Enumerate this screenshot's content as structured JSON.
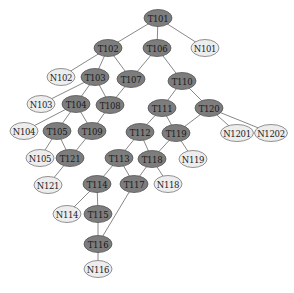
{
  "diagram": {
    "type": "tree",
    "node_style": {
      "task_fill": "#7d7d7d",
      "leaf_fill": "#ededed",
      "edge_color": "#6a6a6a",
      "rx": 14,
      "ry": 8.5
    },
    "nodes": [
      {
        "id": "T101",
        "label": "T101",
        "kind": "t",
        "x": 158,
        "y": 18
      },
      {
        "id": "T102",
        "label": "T102",
        "kind": "t",
        "x": 108,
        "y": 48
      },
      {
        "id": "T106",
        "label": "T106",
        "kind": "t",
        "x": 157,
        "y": 48
      },
      {
        "id": "N101",
        "label": "N101",
        "kind": "n",
        "x": 205,
        "y": 48
      },
      {
        "id": "N102",
        "label": "N102",
        "kind": "n",
        "x": 61,
        "y": 77
      },
      {
        "id": "T103",
        "label": "T103",
        "kind": "t",
        "x": 95,
        "y": 77
      },
      {
        "id": "T107",
        "label": "T107",
        "kind": "t",
        "x": 131,
        "y": 79
      },
      {
        "id": "T110",
        "label": "T110",
        "kind": "t",
        "x": 182,
        "y": 81
      },
      {
        "id": "N103",
        "label": "N103",
        "kind": "n",
        "x": 41,
        "y": 104
      },
      {
        "id": "T104",
        "label": "T104",
        "kind": "t",
        "x": 76,
        "y": 104
      },
      {
        "id": "T108",
        "label": "T108",
        "kind": "t",
        "x": 110,
        "y": 105
      },
      {
        "id": "T111",
        "label": "T111",
        "kind": "t",
        "x": 162,
        "y": 108
      },
      {
        "id": "T120",
        "label": "T120",
        "kind": "t",
        "x": 209,
        "y": 108
      },
      {
        "id": "N104",
        "label": "N104",
        "kind": "n",
        "x": 24,
        "y": 131
      },
      {
        "id": "T105",
        "label": "T105",
        "kind": "t",
        "x": 57,
        "y": 131
      },
      {
        "id": "T109",
        "label": "T109",
        "kind": "t",
        "x": 92,
        "y": 131
      },
      {
        "id": "T112",
        "label": "T112",
        "kind": "t",
        "x": 140,
        "y": 132
      },
      {
        "id": "T119",
        "label": "T119",
        "kind": "t",
        "x": 176,
        "y": 133
      },
      {
        "id": "N1201",
        "label": "N1201",
        "kind": "n",
        "x": 237,
        "y": 133
      },
      {
        "id": "N1202",
        "label": "N1202",
        "kind": "n",
        "x": 271,
        "y": 133
      },
      {
        "id": "N105",
        "label": "N105",
        "kind": "n",
        "x": 40,
        "y": 158
      },
      {
        "id": "T121",
        "label": "T121",
        "kind": "t",
        "x": 70,
        "y": 158
      },
      {
        "id": "T113",
        "label": "T113",
        "kind": "t",
        "x": 119,
        "y": 158
      },
      {
        "id": "T118",
        "label": "T118",
        "kind": "t",
        "x": 152,
        "y": 159
      },
      {
        "id": "N119",
        "label": "N119",
        "kind": "n",
        "x": 193,
        "y": 159
      },
      {
        "id": "N121",
        "label": "N121",
        "kind": "n",
        "x": 48,
        "y": 185
      },
      {
        "id": "T114",
        "label": "T114",
        "kind": "t",
        "x": 97,
        "y": 184
      },
      {
        "id": "T117",
        "label": "T117",
        "kind": "t",
        "x": 134,
        "y": 184
      },
      {
        "id": "N118",
        "label": "N118",
        "kind": "n",
        "x": 168,
        "y": 184
      },
      {
        "id": "N114",
        "label": "N114",
        "kind": "n",
        "x": 67,
        "y": 214
      },
      {
        "id": "T115",
        "label": "T115",
        "kind": "t",
        "x": 98,
        "y": 214
      },
      {
        "id": "T116",
        "label": "T116",
        "kind": "t",
        "x": 98,
        "y": 244
      },
      {
        "id": "N116",
        "label": "N116",
        "kind": "n",
        "x": 98,
        "y": 269
      }
    ],
    "edges": [
      [
        "T101",
        "T102"
      ],
      [
        "T101",
        "T106"
      ],
      [
        "T101",
        "N101"
      ],
      [
        "T102",
        "N102"
      ],
      [
        "T102",
        "T103"
      ],
      [
        "T102",
        "T107"
      ],
      [
        "T106",
        "T107"
      ],
      [
        "T106",
        "T110"
      ],
      [
        "T103",
        "N103"
      ],
      [
        "T103",
        "T104"
      ],
      [
        "T103",
        "T108"
      ],
      [
        "T107",
        "T108"
      ],
      [
        "T110",
        "T111"
      ],
      [
        "T110",
        "T120"
      ],
      [
        "T104",
        "N104"
      ],
      [
        "T104",
        "T105"
      ],
      [
        "T104",
        "T109"
      ],
      [
        "T108",
        "T109"
      ],
      [
        "T111",
        "T112"
      ],
      [
        "T111",
        "T119"
      ],
      [
        "T120",
        "T119"
      ],
      [
        "T120",
        "N1201"
      ],
      [
        "T120",
        "N1202"
      ],
      [
        "T105",
        "N105"
      ],
      [
        "T105",
        "T121"
      ],
      [
        "T109",
        "T121"
      ],
      [
        "T112",
        "T113"
      ],
      [
        "T112",
        "T118"
      ],
      [
        "T119",
        "T118"
      ],
      [
        "T119",
        "N119"
      ],
      [
        "T121",
        "N121"
      ],
      [
        "T113",
        "T114"
      ],
      [
        "T113",
        "T117"
      ],
      [
        "T118",
        "T117"
      ],
      [
        "T118",
        "N118"
      ],
      [
        "T114",
        "N114"
      ],
      [
        "T114",
        "T115"
      ],
      [
        "T115",
        "T116"
      ],
      [
        "T117",
        "T116"
      ],
      [
        "T116",
        "N116"
      ]
    ]
  }
}
